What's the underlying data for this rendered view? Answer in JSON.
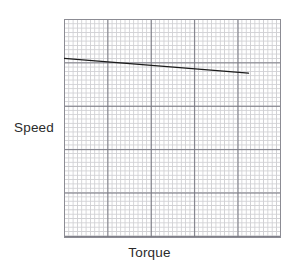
{
  "figure": {
    "background_color": "#ffffff",
    "ylabel": "Speed",
    "xlabel": "Torque"
  },
  "plot": {
    "grid_minor_color": "#c8c8cc",
    "grid_major_color": "#6e6e78",
    "frame_color": "#8c8c94",
    "line_color": "#1a1a1a"
  },
  "chart_data": {
    "type": "line",
    "title": "",
    "subtitle": "",
    "xlabel": "Torque",
    "ylabel": "Speed",
    "xlim": [
      0,
      100
    ],
    "ylim": [
      0,
      100
    ],
    "xticks": [
      0,
      20,
      40,
      60,
      80,
      100
    ],
    "yticks": [
      0,
      20,
      40,
      60,
      80,
      100
    ],
    "xtick_labels": [],
    "ytick_labels": [],
    "grid": true,
    "grid_style": "graph-paper",
    "minor_grid": true,
    "minor_ticks_per_major": 10,
    "legend": false,
    "legend_position": "none",
    "annotations": [],
    "series": [
      {
        "name": "Speed-torque characteristic",
        "color": "#1a1a1a",
        "linewidth": 1.4,
        "x": [
          0,
          85
        ],
        "y": [
          82,
          75.3
        ],
        "description": "Straight line sloping gently downward from upper-left toward the right, ending before the right edge of the plot."
      }
    ]
  }
}
